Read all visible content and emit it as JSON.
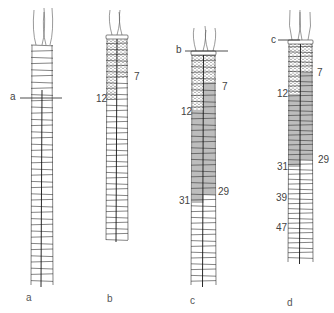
{
  "figure": {
    "colors": {
      "line": "#333333",
      "stipple_bg": "#ffffff",
      "stipple_dot": "#555555",
      "shade": "#bdbdbd",
      "background": "#ffffff"
    },
    "panels": [
      {
        "id": "a",
        "label": "a",
        "cut_label": "a",
        "segment_markers": []
      },
      {
        "id": "b",
        "label": "b",
        "segment_markers": [
          {
            "text": "7",
            "side": "right"
          },
          {
            "text": "12",
            "side": "left"
          }
        ]
      },
      {
        "id": "c",
        "label": "c",
        "cut_label": "b",
        "segment_markers": [
          {
            "text": "7",
            "side": "right"
          },
          {
            "text": "12",
            "side": "left"
          },
          {
            "text": "29",
            "side": "right"
          },
          {
            "text": "31",
            "side": "left"
          }
        ]
      },
      {
        "id": "d",
        "label": "d",
        "cut_label": "c",
        "segment_markers": [
          {
            "text": "7",
            "side": "right"
          },
          {
            "text": "12",
            "side": "left"
          },
          {
            "text": "29",
            "side": "right"
          },
          {
            "text": "31",
            "side": "left"
          },
          {
            "text": "39",
            "side": "left"
          },
          {
            "text": "47",
            "side": "left"
          }
        ]
      }
    ]
  }
}
